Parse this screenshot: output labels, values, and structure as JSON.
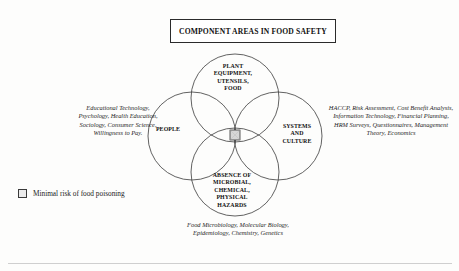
{
  "figure": {
    "title": "COMPONENT AREAS IN FOOD SAFETY",
    "background_color": "#fdfdfc",
    "line_color": "#3a3a3a"
  },
  "venn": {
    "circles": [
      {
        "id": "top",
        "label": "PLANT\nEQUIPMENT,\nUTENSILS,\nFOOD"
      },
      {
        "id": "left",
        "label": "PEOPLE"
      },
      {
        "id": "right",
        "label": "SYSTEMS\nAND\nCULTURE"
      },
      {
        "id": "bottom",
        "label": "ABSENCE OF\nMICROBIAL,\nCHEMICAL,\nPHYSICAL\nHAZARDS"
      }
    ],
    "center_marker": "shaded-square"
  },
  "circle_labels": {
    "top": "PLANT EQUIPMENT, UTENSILS, FOOD",
    "top_lines": [
      "PLANT",
      "EQUIPMENT,",
      "UTENSILS,",
      "FOOD"
    ],
    "left": "PEOPLE",
    "left_lines": [
      "PEOPLE"
    ],
    "right": "SYSTEMS AND CULTURE",
    "right_lines": [
      "SYSTEMS",
      "AND",
      "CULTURE"
    ],
    "bottom": "ABSENCE OF MICROBIAL, CHEMICAL, PHYSICAL HAZARDS",
    "bottom_lines": [
      "ABSENCE OF",
      "MICROBIAL,",
      "CHEMICAL,",
      "PHYSICAL",
      "HAZARDS"
    ]
  },
  "annotations": {
    "left": "Educational Technology, Psychology, Health Education, Sociology, Consumer Science, Willingness to Pay.",
    "right": "HACCP, Risk Assessment, Cost Benefit Analysis, Information Technology, Financial Planning, HRM Surveys, Questionnaires, Management Theory, Economics",
    "bottom": "Food Microbiology, Molecular Biology, Epidemiology, Chemistry, Genetics"
  },
  "legend": {
    "swatch_label": "Minimal risk of food poisoning"
  }
}
